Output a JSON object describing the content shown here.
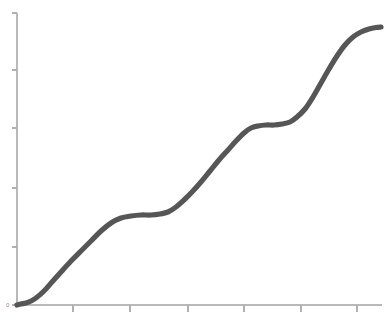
{
  "chart_data": {
    "type": "line",
    "title": "",
    "subtitle": "",
    "xlabel": "",
    "ylabel": "",
    "legend": [],
    "grid": false,
    "legend_position": "none",
    "xlim": [
      0,
      6.4
    ],
    "ylim": [
      0,
      5.1
    ],
    "x_ticks": [
      1,
      2,
      3,
      4,
      5,
      6
    ],
    "x_tick_labels": [
      "",
      "",
      "",
      "",
      "",
      ""
    ],
    "y_ticks": [
      0,
      1,
      2,
      3,
      4,
      5
    ],
    "y_tick_labels": [
      "0",
      "",
      "",
      "",
      "",
      ""
    ],
    "series": [
      {
        "name": "cumulative-step-curve",
        "color": "#565656",
        "line_width": 5.2,
        "x": [
          0.0,
          0.15,
          0.3,
          0.45,
          0.6,
          0.75,
          0.9,
          1.05,
          1.2,
          1.35,
          1.5,
          1.65,
          1.8,
          1.95,
          2.1,
          2.25,
          2.4,
          2.55,
          2.7,
          2.85,
          3.0,
          3.15,
          3.3,
          3.45,
          3.6,
          3.75,
          3.9,
          4.05,
          4.2,
          4.35,
          4.5,
          4.65,
          4.8,
          4.95,
          5.1,
          5.25,
          5.4,
          5.55,
          5.7,
          5.85,
          6.0,
          6.15,
          6.3
        ],
        "y": [
          0.0,
          0.02,
          0.05,
          0.1,
          0.19,
          0.33,
          0.5,
          0.68,
          0.86,
          1.04,
          1.22,
          1.38,
          1.5,
          1.56,
          1.58,
          1.59,
          1.62,
          1.7,
          1.83,
          2.0,
          2.19,
          2.38,
          2.56,
          2.72,
          2.85,
          2.94,
          2.98,
          3.0,
          3.01,
          3.04,
          3.12,
          3.28,
          3.52,
          3.82,
          4.12,
          4.38,
          4.58,
          4.7,
          4.77,
          4.8,
          4.81,
          4.82,
          4.82
        ]
      }
    ]
  },
  "axes": {
    "y_axis_name": "y-axis",
    "x_axis_name": "x-axis",
    "origin_label": "0",
    "axis_color": "#b9b9b9",
    "tick_color": "#b0b0b0"
  },
  "geometry": {
    "width": 388,
    "height": 329,
    "plot_left": 17,
    "plot_right": 382,
    "plot_top": 13,
    "plot_bottom": 305,
    "y_tick_pixels": [
      305,
      247,
      188,
      128,
      70,
      13
    ],
    "x_tick_pixels": [
      73,
      130,
      188,
      244,
      301,
      357
    ],
    "curve_points_px": [
      [
        17,
        305
      ],
      [
        21,
        304
      ],
      [
        26,
        303
      ],
      [
        31,
        301
      ],
      [
        36,
        298
      ],
      [
        44,
        291
      ],
      [
        52,
        282
      ],
      [
        61,
        272
      ],
      [
        71,
        261
      ],
      [
        81,
        251
      ],
      [
        91,
        241
      ],
      [
        101,
        231
      ],
      [
        111,
        223
      ],
      [
        121,
        218
      ],
      [
        131,
        216
      ],
      [
        141,
        215
      ],
      [
        151,
        215
      ],
      [
        160,
        214
      ],
      [
        168,
        212
      ],
      [
        176,
        207
      ],
      [
        184,
        200
      ],
      [
        192,
        192
      ],
      [
        201,
        182
      ],
      [
        210,
        171
      ],
      [
        219,
        160
      ],
      [
        228,
        150
      ],
      [
        236,
        141
      ],
      [
        244,
        133
      ],
      [
        251,
        128
      ],
      [
        258,
        126
      ],
      [
        266,
        125
      ],
      [
        274,
        125
      ],
      [
        282,
        124
      ],
      [
        290,
        122
      ],
      [
        297,
        117
      ],
      [
        305,
        109
      ],
      [
        313,
        97
      ],
      [
        321,
        83
      ],
      [
        329,
        69
      ],
      [
        337,
        56
      ],
      [
        345,
        45
      ],
      [
        353,
        37
      ],
      [
        361,
        32
      ],
      [
        369,
        29
      ],
      [
        376,
        27.5
      ],
      [
        381,
        27
      ]
    ]
  }
}
